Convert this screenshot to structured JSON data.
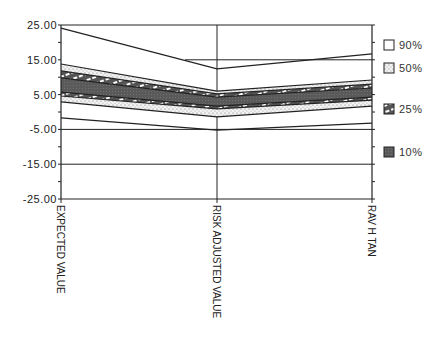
{
  "chart_data": {
    "type": "area",
    "title": "",
    "xlabel": "",
    "ylabel": "",
    "categories": [
      "EXPECTED VALUE",
      "RISK ADJUSTED VALUE",
      "RAV H TAN"
    ],
    "ylim": [
      -25,
      25
    ],
    "yticks": [
      25,
      15,
      5,
      -5,
      -15,
      -25
    ],
    "ytick_labels": [
      "25.00",
      "15.00",
      "5.00",
      "-5.00",
      "-15.00",
      "-25.00"
    ],
    "grid": {
      "horizontal": [
        25,
        15,
        -5,
        -15,
        -25
      ],
      "vertical_at_categories": true
    },
    "legend_position": "right",
    "series": [
      {
        "name": "max",
        "values": [
          24.1,
          12.4,
          16.7
        ]
      },
      {
        "name": "90% upper",
        "values": [
          13.8,
          6.0,
          9.2
        ]
      },
      {
        "name": "50% upper",
        "values": [
          11.8,
          5.2,
          8.0
        ]
      },
      {
        "name": "25% upper",
        "values": [
          9.8,
          4.3,
          6.9
        ]
      },
      {
        "name": "25% lower",
        "values": [
          5.7,
          1.7,
          4.3
        ]
      },
      {
        "name": "50% lower",
        "values": [
          4.6,
          0.9,
          3.4
        ]
      },
      {
        "name": "90% lower",
        "values": [
          2.9,
          -1.4,
          1.7
        ]
      },
      {
        "name": "min",
        "values": [
          -1.7,
          -5.2,
          -3.2
        ]
      }
    ],
    "bands": [
      {
        "label": "90%",
        "upper": "max",
        "lower": "min",
        "fill": "none"
      },
      {
        "label": "50%",
        "upper": "90% upper",
        "lower": "90% lower",
        "fill": "dots"
      },
      {
        "label": "25%",
        "upper": "50% upper",
        "lower": "50% lower",
        "fill": "hatch"
      },
      {
        "label": "10%",
        "upper": "25% upper",
        "lower": "25% lower",
        "fill": "dark"
      }
    ],
    "legend": [
      {
        "label": "90%",
        "pattern": "none"
      },
      {
        "label": "50%",
        "pattern": "dots"
      },
      {
        "label": "25%",
        "pattern": "hatch"
      },
      {
        "label": "10%",
        "pattern": "dark"
      }
    ]
  },
  "colors": {
    "line": "#222222",
    "dark_band": "#5a5a5a",
    "dot_band": "#d8d8d8",
    "background": "#ffffff"
  }
}
